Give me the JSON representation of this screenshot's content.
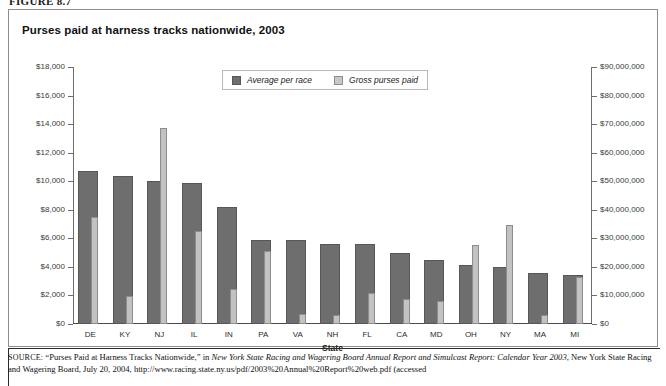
{
  "figure": {
    "label": "FIGURE 8.7"
  },
  "chart": {
    "title": "Purses paid at harness tracks nationwide, 2003"
  },
  "legend": {
    "items": [
      {
        "label": "Average per race",
        "swatch": "dark-gray-swatch",
        "color": "#6e6e6e"
      },
      {
        "label": "Gross purses paid",
        "swatch": "light-gray-swatch",
        "color": "#c8c8c8"
      }
    ]
  },
  "source": {
    "prefix": "SOURCE:",
    "line1a": "“Purses Paid at Harness Tracks Nationwide,” in ",
    "line1b": "New York State Racing and Wagering Board Annual Report and Simulcast Report: Calendar Year 2003",
    "line1c": ", New York State Racing and Wagering Board, July 20, 2004, http://www.racing.state.ny.us/pdf/2003%20Annual%20Report%20web.pdf (accessed"
  },
  "chart_data": {
    "type": "bar",
    "title": "Purses paid at harness tracks nationwide, 2003",
    "xlabel": "State",
    "ylabel": "",
    "grid": false,
    "legend_position": "top-center",
    "categories": [
      "DE",
      "KY",
      "NJ",
      "IL",
      "IN",
      "PA",
      "VA",
      "NH",
      "FL",
      "CA",
      "MD",
      "OH",
      "NY",
      "MA",
      "MI"
    ],
    "series": [
      {
        "name": "Average per race",
        "axis": "left",
        "color": "#6e6e6e",
        "values": [
          10700,
          10400,
          10050,
          9850,
          8200,
          5900,
          5900,
          5600,
          5600,
          5000,
          4500,
          4100,
          4000,
          3550,
          3450
        ]
      },
      {
        "name": "Gross purses paid",
        "axis": "right",
        "color": "#c8c8c8",
        "values": [
          37500000,
          9900000,
          68500000,
          32500000,
          12400000,
          25500000,
          3500000,
          3200000,
          10700000,
          8600000,
          8200000,
          27700000,
          34700000,
          3300000,
          16400000
        ]
      }
    ],
    "left_axis": {
      "label": "Average per race",
      "ylim": [
        0,
        18000
      ],
      "tick_step": 2000,
      "ticks": [
        "$0",
        "$2,000",
        "$4,000",
        "$6,000",
        "$8,000",
        "$10,000",
        "$12,000",
        "$14,000",
        "$16,000",
        "$18,000"
      ]
    },
    "right_axis": {
      "label": "Gross purses paid",
      "ylim": [
        0,
        90000000
      ],
      "tick_step": 10000000,
      "ticks": [
        "$0",
        "$10,000,000",
        "$20,000,000",
        "$30,000,000",
        "$40,000,000",
        "$50,000,000",
        "$60,000,000",
        "$70,000,000",
        "$80,000,000",
        "$90,000,000"
      ]
    }
  }
}
